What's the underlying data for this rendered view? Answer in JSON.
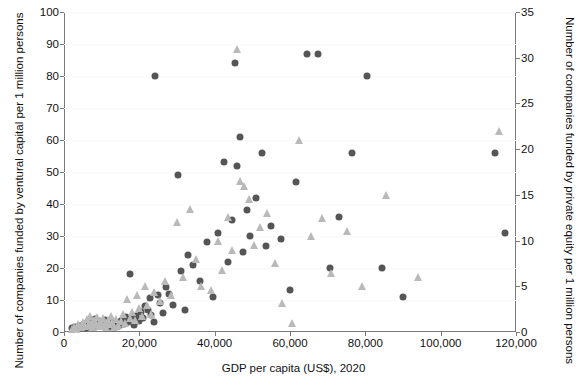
{
  "chart_data": {
    "type": "scatter",
    "title": "",
    "xlabel": "GDP per capita (US$), 2020",
    "ylabel_left": "Number of companies funded by ventural capital per 1 million persons",
    "ylabel_right": "Number of companies funded by private equity per 1 million persons",
    "xlim": [
      0,
      120000
    ],
    "ylim_left": [
      0,
      100
    ],
    "ylim_right": [
      0,
      35
    ],
    "xticks": [
      0,
      20000,
      40000,
      60000,
      80000,
      100000,
      120000
    ],
    "xticklabels": [
      "0",
      "20,000",
      "40,000",
      "60,000",
      "80,000",
      "100,000",
      "120,000"
    ],
    "yticks_left": [
      0,
      10,
      20,
      30,
      40,
      50,
      60,
      70,
      80,
      90,
      100
    ],
    "yticklabels_left": [
      "0",
      "10",
      "20",
      "30",
      "40",
      "50",
      "60",
      "70",
      "80",
      "90",
      "100"
    ],
    "yticks_right": [
      0,
      5,
      10,
      15,
      20,
      25,
      30,
      35
    ],
    "yticklabels_right": [
      "0",
      "5",
      "10",
      "15",
      "20",
      "25",
      "30",
      "35"
    ],
    "grid": false,
    "legend": "none",
    "series": [
      {
        "name": "venture capital",
        "marker": "circle",
        "color": "#555555",
        "axis": "left",
        "points": [
          [
            2200,
            1.2
          ],
          [
            3000,
            1.6
          ],
          [
            3600,
            1.0
          ],
          [
            4200,
            2.0
          ],
          [
            4800,
            1.4
          ],
          [
            5200,
            2.4
          ],
          [
            5800,
            1.1
          ],
          [
            6200,
            2.8
          ],
          [
            6600,
            1.8
          ],
          [
            7000,
            3.0
          ],
          [
            7400,
            2.2
          ],
          [
            7800,
            1.5
          ],
          [
            8200,
            4.2
          ],
          [
            8600,
            2.6
          ],
          [
            9000,
            1.9
          ],
          [
            9400,
            3.4
          ],
          [
            9800,
            2.1
          ],
          [
            10200,
            3.0
          ],
          [
            10600,
            2.3
          ],
          [
            11000,
            3.6
          ],
          [
            11400,
            2.0
          ],
          [
            11800,
            2.8
          ],
          [
            12200,
            1.7
          ],
          [
            12600,
            3.1
          ],
          [
            13000,
            2.4
          ],
          [
            13400,
            1.3
          ],
          [
            14000,
            2.9
          ],
          [
            14600,
            2.0
          ],
          [
            15200,
            3.5
          ],
          [
            15800,
            2.6
          ],
          [
            16400,
            4.6
          ],
          [
            17000,
            3.0
          ],
          [
            17600,
            18.0
          ],
          [
            18200,
            4.0
          ],
          [
            18600,
            2.2
          ],
          [
            19200,
            5.0
          ],
          [
            19800,
            3.4
          ],
          [
            20400,
            6.2
          ],
          [
            21000,
            4.4
          ],
          [
            21600,
            8.0
          ],
          [
            22200,
            6.8
          ],
          [
            22800,
            10.5
          ],
          [
            23200,
            5.2
          ],
          [
            23800,
            3.0
          ],
          [
            24200,
            80.0
          ],
          [
            25000,
            11.5
          ],
          [
            25600,
            9.0
          ],
          [
            26200,
            6.0
          ],
          [
            27000,
            14.0
          ],
          [
            28000,
            12.0
          ],
          [
            29000,
            8.5
          ],
          [
            30200,
            49.0
          ],
          [
            31000,
            19.0
          ],
          [
            32000,
            7.0
          ],
          [
            33000,
            24.0
          ],
          [
            34200,
            21.0
          ],
          [
            36000,
            16.0
          ],
          [
            38000,
            28.0
          ],
          [
            39500,
            11.0
          ],
          [
            41000,
            31.0
          ],
          [
            42500,
            53.0
          ],
          [
            43500,
            22.0
          ],
          [
            44500,
            35.0
          ],
          [
            45500,
            84.0
          ],
          [
            46000,
            52.0
          ],
          [
            46800,
            61.0
          ],
          [
            47500,
            25.0
          ],
          [
            48500,
            38.0
          ],
          [
            49500,
            30.0
          ],
          [
            51000,
            42.0
          ],
          [
            52500,
            56.0
          ],
          [
            53500,
            27.0
          ],
          [
            55000,
            33.0
          ],
          [
            57500,
            29.0
          ],
          [
            60000,
            13.0
          ],
          [
            61500,
            47.0
          ],
          [
            64500,
            87.0
          ],
          [
            67500,
            87.0
          ],
          [
            70500,
            20.0
          ],
          [
            73000,
            36.0
          ],
          [
            76500,
            56.0
          ],
          [
            80500,
            80.0
          ],
          [
            84500,
            20.0
          ],
          [
            90000,
            11.0
          ],
          [
            114500,
            56.0
          ],
          [
            117000,
            31.0
          ]
        ]
      },
      {
        "name": "private equity",
        "marker": "triangle",
        "color": "#b9b9b9",
        "axis": "right",
        "points": [
          [
            2000,
            0.3
          ],
          [
            2600,
            0.6
          ],
          [
            3200,
            0.4
          ],
          [
            3800,
            0.9
          ],
          [
            4400,
            0.5
          ],
          [
            5000,
            1.1
          ],
          [
            5600,
            0.7
          ],
          [
            6000,
            1.4
          ],
          [
            6400,
            0.8
          ],
          [
            6800,
            1.8
          ],
          [
            7200,
            1.0
          ],
          [
            7600,
            0.6
          ],
          [
            8000,
            1.3
          ],
          [
            8400,
            0.9
          ],
          [
            8800,
            1.6
          ],
          [
            9200,
            0.7
          ],
          [
            9600,
            1.2
          ],
          [
            10000,
            0.8
          ],
          [
            10400,
            1.5
          ],
          [
            10800,
            1.0
          ],
          [
            11200,
            0.6
          ],
          [
            11600,
            1.3
          ],
          [
            12000,
            0.9
          ],
          [
            12400,
            1.7
          ],
          [
            12800,
            1.1
          ],
          [
            13200,
            0.5
          ],
          [
            13800,
            1.4
          ],
          [
            14400,
            0.8
          ],
          [
            15000,
            1.2
          ],
          [
            15600,
            2.0
          ],
          [
            16200,
            1.0
          ],
          [
            16800,
            3.6
          ],
          [
            17400,
            1.5
          ],
          [
            18000,
            2.2
          ],
          [
            18800,
            1.3
          ],
          [
            19400,
            4.0
          ],
          [
            20000,
            2.6
          ],
          [
            20800,
            1.8
          ],
          [
            21400,
            5.0
          ],
          [
            22000,
            3.0
          ],
          [
            23000,
            2.0
          ],
          [
            24000,
            4.4
          ],
          [
            25400,
            3.4
          ],
          [
            26800,
            5.6
          ],
          [
            28400,
            4.0
          ],
          [
            30000,
            12.0
          ],
          [
            31500,
            6.0
          ],
          [
            33500,
            13.5
          ],
          [
            35000,
            8.0
          ],
          [
            36500,
            5.0
          ],
          [
            39000,
            4.6
          ],
          [
            41000,
            10.0
          ],
          [
            42000,
            6.8
          ],
          [
            43500,
            12.6
          ],
          [
            44500,
            9.0
          ],
          [
            45800,
            31.0
          ],
          [
            46800,
            16.5
          ],
          [
            47800,
            16.0
          ],
          [
            49000,
            14.5
          ],
          [
            50500,
            9.5
          ],
          [
            52000,
            11.5
          ],
          [
            54000,
            13.0
          ],
          [
            56000,
            7.5
          ],
          [
            58000,
            3.2
          ],
          [
            60500,
            1.0
          ],
          [
            62500,
            21.0
          ],
          [
            65500,
            10.5
          ],
          [
            68500,
            12.5
          ],
          [
            71000,
            6.5
          ],
          [
            75000,
            11.0
          ],
          [
            79000,
            5.0
          ],
          [
            85500,
            15.0
          ],
          [
            94000,
            6.0
          ],
          [
            115500,
            22.0
          ]
        ]
      }
    ]
  }
}
